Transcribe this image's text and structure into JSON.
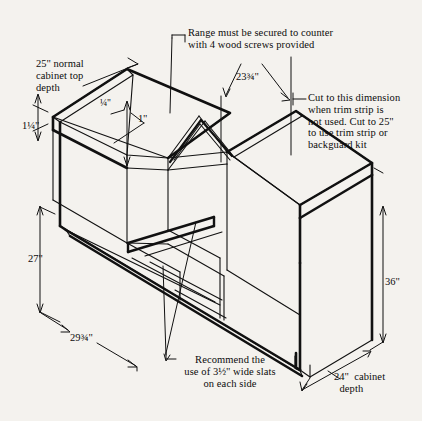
{
  "diagram": {
    "ink_color": "#111111",
    "background_color": "#f4f2ee"
  },
  "annotations": {
    "cabinet_top_depth": "25'' normal\ncabinet top\ndepth",
    "top_thickness": "1¼''",
    "gap_quarter": "¼''",
    "gap_one_inch": "1''",
    "secure_note": "Range must be secured to counter\nwith 4 wood screws provided",
    "cut_width": "23¾''",
    "cut_note": "Cut to this dimension\nwhen trim strip is\nnot used. Cut to 25''\nto use trim strip or\nbackguard kit",
    "height_27": "27''",
    "height_36": "36''",
    "width_29": "29¾''",
    "cabinet_depth_24": "24''  cabinet\n  depth",
    "slats_note": "Recommend the\nuse of 3½'' wide slats\non each side"
  }
}
